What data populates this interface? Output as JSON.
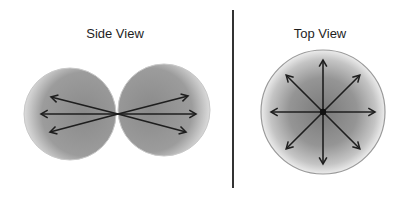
{
  "side_view": {
    "title": "Side View",
    "title_pos": {
      "x": 115,
      "y": 26
    },
    "convergence_point": {
      "x": 118,
      "y": 114
    },
    "lobes": [
      {
        "name": "left-lobe",
        "cx": 70,
        "cy": 114,
        "r": 46,
        "arrow_tips": [
          {
            "x": 51,
            "y": 97
          },
          {
            "x": 41,
            "y": 114
          },
          {
            "x": 50,
            "y": 132
          }
        ]
      },
      {
        "name": "right-lobe",
        "cx": 164,
        "cy": 110,
        "r": 46,
        "arrow_tips": [
          {
            "x": 188,
            "y": 96
          },
          {
            "x": 196,
            "y": 114
          },
          {
            "x": 186,
            "y": 132
          }
        ]
      }
    ]
  },
  "divider": {
    "x": 233,
    "y1": 10,
    "y2": 188
  },
  "top_view": {
    "title": "Top View",
    "title_pos": {
      "x": 320,
      "y": 26
    },
    "circle": {
      "cx": 323,
      "cy": 112,
      "r": 62
    },
    "arrow_length": 52,
    "arrow_directions_deg": [
      0,
      45,
      90,
      135,
      180,
      225,
      270,
      315
    ]
  },
  "colors": {
    "lobe_fill": "#8f8f8f",
    "lobe_edge": "#c8c8c8",
    "top_fill_center": "#7a7a7a",
    "top_fill_edge": "#e6e6e6",
    "top_outline": "#9a9a9a",
    "arrow": "#1e1e1e",
    "divider": "#333333"
  }
}
